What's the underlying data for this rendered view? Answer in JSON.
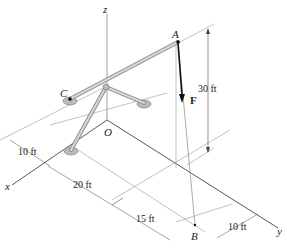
{
  "diagram": {
    "type": "3D statics structure",
    "points": {
      "A": "A",
      "B": "B",
      "C": "C",
      "O": "O"
    },
    "axes": {
      "x": "x",
      "y": "y",
      "z": "z"
    },
    "force": {
      "label": "F",
      "from": "A",
      "toward": "B"
    },
    "dimensions": [
      {
        "id": "height",
        "label": "30 ft"
      },
      {
        "id": "x_offset",
        "label": "10 ft"
      },
      {
        "id": "x_to_b_first",
        "label": "20 ft"
      },
      {
        "id": "x_to_b_second",
        "label": "15 ft"
      },
      {
        "id": "y_offset",
        "label": "10 ft"
      }
    ],
    "colors": {
      "line": "#444444",
      "member_fill": "#c8c8c8",
      "member_edge": "#8a8a8a",
      "force": "#111111"
    }
  }
}
